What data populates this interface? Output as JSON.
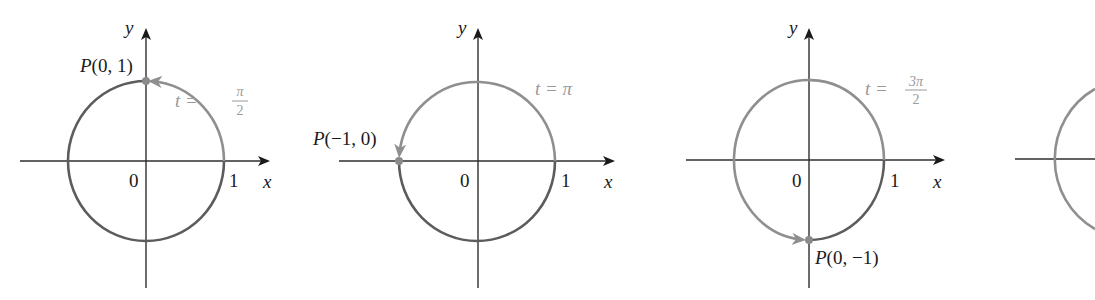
{
  "figure": {
    "panels": [
      {
        "id": "t-pi-over-2",
        "t_label_prefix": "t =",
        "t_num": "π",
        "t_den": "2",
        "point_label": "P(0, 1)",
        "point_prefix": "P",
        "point_coords": "(0, 1)",
        "origin_label": "0",
        "one_label": "1",
        "x_label": "x",
        "y_label": "y"
      },
      {
        "id": "t-pi",
        "t_label_prefix": "t =",
        "t_value": "π",
        "point_label": "P(−1, 0)",
        "point_prefix": "P",
        "point_coords": "(−1, 0)",
        "origin_label": "0",
        "one_label": "1",
        "x_label": "x",
        "y_label": "y"
      },
      {
        "id": "t-3pi-over-2",
        "t_label_prefix": "t =",
        "t_num": "3π",
        "t_den": "2",
        "point_label": "P(0, −1)",
        "point_prefix": "P",
        "point_coords": "(0, −1)",
        "origin_label": "0",
        "one_label": "1",
        "x_label": "x",
        "y_label": "y"
      },
      {
        "id": "partial-fourth",
        "note": "partially visible, cropped at right edge"
      }
    ],
    "colors": {
      "axis": "#2e2e2e",
      "arc_traversed": "#8f8f8f",
      "arc_remaining": "#5c5c5c",
      "t_label": "#9a9a9a",
      "text": "#1a1a1a"
    }
  }
}
